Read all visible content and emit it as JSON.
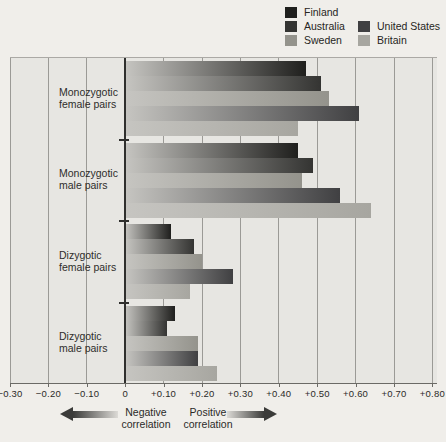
{
  "chart_data": {
    "type": "bar",
    "orientation": "horizontal",
    "title": "",
    "xlabel": "correlation",
    "ylabel": "",
    "xlim": [
      -0.3,
      0.8
    ],
    "xticks": [
      -0.3,
      -0.2,
      -0.1,
      0,
      0.1,
      0.2,
      0.3,
      0.4,
      0.5,
      0.6,
      0.7,
      0.8
    ],
    "xtick_labels": [
      "−0.30",
      "−0.20",
      "−0.10",
      "0",
      "+0.10",
      "+0.20",
      "+0.30",
      "+0.40",
      "+0.50",
      "+0.60",
      "+0.70",
      "+0.80"
    ],
    "grid": "vertical",
    "legend_position": "top-right",
    "bar_gradient_start": "#c6c5c1",
    "categories": [
      "Monozygotic female pairs",
      "Monozygotic male pairs",
      "Dizygotic female pairs",
      "Dizygotic male pairs"
    ],
    "category_lines": [
      {
        "line1": "Monozygotic",
        "line2": "female pairs"
      },
      {
        "line1": "Monozygotic",
        "line2": "male pairs"
      },
      {
        "line1": "Dizygotic",
        "line2": "female pairs"
      },
      {
        "line1": "Dizygotic",
        "line2": "male pairs"
      }
    ],
    "series": [
      {
        "name": "Finland",
        "color": "#1f1f1d",
        "values": [
          0.47,
          0.45,
          0.12,
          0.13
        ]
      },
      {
        "name": "Australia",
        "color": "#343432",
        "values": [
          0.51,
          0.49,
          0.18,
          0.11
        ]
      },
      {
        "name": "Sweden",
        "color": "#94938c",
        "values": [
          0.53,
          0.46,
          0.2,
          0.19
        ]
      },
      {
        "name": "United States",
        "color": "#404042",
        "values": [
          0.61,
          0.56,
          0.28,
          0.19
        ]
      },
      {
        "name": "Britain",
        "color": "#a7a6a0",
        "values": [
          0.45,
          0.64,
          0.17,
          0.24
        ]
      }
    ]
  },
  "legend": {
    "items": [
      {
        "label": "Finland",
        "color": "#1f1f1d"
      },
      {
        "label": "Australia",
        "color": "#343432"
      },
      {
        "label": "Sweden",
        "color": "#94938c"
      },
      {
        "label": "United States",
        "color": "#404042"
      },
      {
        "label": "Britain",
        "color": "#a7a6a0"
      }
    ]
  },
  "annotations": {
    "negative": {
      "line1": "Negative",
      "line2": "correlation"
    },
    "positive": {
      "line1": "Positive",
      "line2": "correlation"
    }
  }
}
